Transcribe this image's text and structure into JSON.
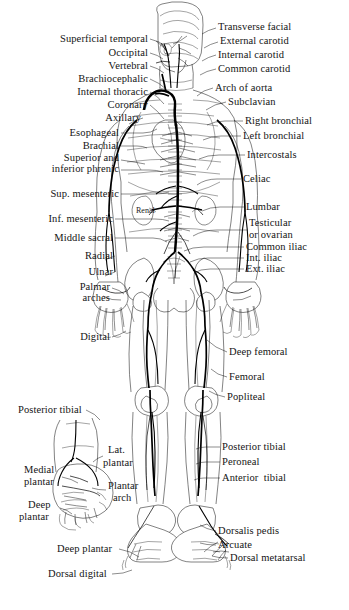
{
  "figure": {
    "background_color": "#ffffff",
    "ink_color": "#1b1b1b",
    "artery_color": "#000000"
  },
  "labels_left": [
    {
      "id": "superficial-temporal",
      "text": "Superficial temporal",
      "x": 148,
      "y": 42
    },
    {
      "id": "occipital",
      "text": "Occipital",
      "x": 148,
      "y": 56
    },
    {
      "id": "vertebral",
      "text": "Vertebral",
      "x": 148,
      "y": 69
    },
    {
      "id": "brachiocephalic",
      "text": "Brachiocephalic",
      "x": 148,
      "y": 82
    },
    {
      "id": "internal-thoracic",
      "text": "Internal thoracic",
      "x": 148,
      "y": 95
    },
    {
      "id": "coronary",
      "text": "Coronary",
      "x": 148,
      "y": 108
    },
    {
      "id": "axillary",
      "text": "Axillary",
      "x": 141,
      "y": 121
    },
    {
      "id": "esophageal",
      "text": "Esophageal",
      "x": 119,
      "y": 136
    },
    {
      "id": "brachial",
      "text": "Brachial",
      "x": 119,
      "y": 149
    },
    {
      "id": "superior-and",
      "text": "Superior and",
      "x": 119,
      "y": 161
    },
    {
      "id": "inferior-phrenic",
      "text": "inferior phrenic",
      "x": 119,
      "y": 172
    },
    {
      "id": "sup-mesenteric",
      "text": "Sup. mesenteric",
      "x": 119,
      "y": 197
    },
    {
      "id": "inf-mesenteric",
      "text": "Inf. mesenteric",
      "x": 113,
      "y": 222
    },
    {
      "id": "middle-sacral",
      "text": "Middle sacral",
      "x": 113,
      "y": 241
    },
    {
      "id": "radial",
      "text": "Radial",
      "x": 113,
      "y": 259
    },
    {
      "id": "ulnar",
      "text": "Ulnar",
      "x": 113,
      "y": 275
    },
    {
      "id": "palmar-arches-1",
      "text": "Palmar",
      "x": 110,
      "y": 290
    },
    {
      "id": "palmar-arches-2",
      "text": "arches",
      "x": 110,
      "y": 301
    },
    {
      "id": "digital",
      "text": "Digital",
      "x": 110,
      "y": 340
    }
  ],
  "labels_right": [
    {
      "id": "transverse-facial",
      "text": "Transverse facial",
      "x": 218,
      "y": 30
    },
    {
      "id": "external-carotid",
      "text": "External carotid",
      "x": 220,
      "y": 44
    },
    {
      "id": "internal-carotid",
      "text": "Internal carotid",
      "x": 218,
      "y": 58
    },
    {
      "id": "common-carotid",
      "text": "Common carotid",
      "x": 218,
      "y": 72
    },
    {
      "id": "arch-of-aorta",
      "text": "Arch of aorta",
      "x": 215,
      "y": 91
    },
    {
      "id": "subclavian",
      "text": "Subclavian",
      "x": 228,
      "y": 105
    },
    {
      "id": "right-bronchial",
      "text": "Right bronchial",
      "x": 245,
      "y": 124
    },
    {
      "id": "left-bronchial",
      "text": "Left bronchial",
      "x": 243,
      "y": 139
    },
    {
      "id": "intercostals",
      "text": "Intercostals",
      "x": 247,
      "y": 158
    },
    {
      "id": "celiac",
      "text": "Celiac",
      "x": 243,
      "y": 182
    },
    {
      "id": "lumbar",
      "text": "Lumbar",
      "x": 246,
      "y": 210
    },
    {
      "id": "testicular-1",
      "text": "Testicular",
      "x": 249,
      "y": 226
    },
    {
      "id": "testicular-2",
      "text": "or ovarian",
      "x": 249,
      "y": 238
    },
    {
      "id": "common-iliac",
      "text": "Common iliac",
      "x": 246,
      "y": 250
    },
    {
      "id": "int-iliac",
      "text": "Int. iliac",
      "x": 246,
      "y": 261
    },
    {
      "id": "ext-iliac",
      "text": "Ext. iliac",
      "x": 246,
      "y": 272
    },
    {
      "id": "deep-femoral",
      "text": "Deep femoral",
      "x": 229,
      "y": 355
    },
    {
      "id": "femoral",
      "text": "Femoral",
      "x": 229,
      "y": 380
    },
    {
      "id": "popliteal",
      "text": "Popliteal",
      "x": 227,
      "y": 400
    },
    {
      "id": "posterior-tibial-r",
      "text": "Posterior tibial",
      "x": 222,
      "y": 450
    },
    {
      "id": "peroneal",
      "text": "Peroneal",
      "x": 222,
      "y": 465
    },
    {
      "id": "anterior-tibial",
      "text": "Anterior  tibial",
      "x": 222,
      "y": 481
    },
    {
      "id": "dorsalis-pedis",
      "text": "Dorsalis pedis",
      "x": 218,
      "y": 534
    },
    {
      "id": "arcuate",
      "text": "Arcuate",
      "x": 218,
      "y": 548
    },
    {
      "id": "dorsal-metatarsal",
      "text": "Dorsal metatarsal",
      "x": 230,
      "y": 561
    }
  ],
  "labels_inset": [
    {
      "id": "posterior-tibial-inset",
      "text": "Posterior tibial",
      "x": 18,
      "y": 413
    },
    {
      "id": "lat-plantar-1",
      "text": "Lat.",
      "x": 108,
      "y": 453
    },
    {
      "id": "lat-plantar-2",
      "text": "plantar",
      "x": 103,
      "y": 466
    },
    {
      "id": "medial-plantar-1",
      "text": "Medial",
      "x": 24,
      "y": 473
    },
    {
      "id": "medial-plantar-2",
      "text": "plantar",
      "x": 24,
      "y": 485
    },
    {
      "id": "plantar-arch-1",
      "text": "Plantar",
      "x": 108,
      "y": 489
    },
    {
      "id": "plantar-arch-2",
      "text": "arch",
      "x": 113,
      "y": 501
    },
    {
      "id": "deep-plantar-inset-1",
      "text": "Deep",
      "x": 28,
      "y": 508
    },
    {
      "id": "deep-plantar-inset-2",
      "text": "plantar",
      "x": 19,
      "y": 520
    },
    {
      "id": "deep-plantar-lower",
      "text": "Deep plantar",
      "x": 57,
      "y": 552
    },
    {
      "id": "dorsal-digital",
      "text": "Dorsal digital",
      "x": 48,
      "y": 577
    }
  ],
  "labels_internal": [
    {
      "id": "renal",
      "text": "Renal",
      "x": 136,
      "y": 212
    }
  ]
}
